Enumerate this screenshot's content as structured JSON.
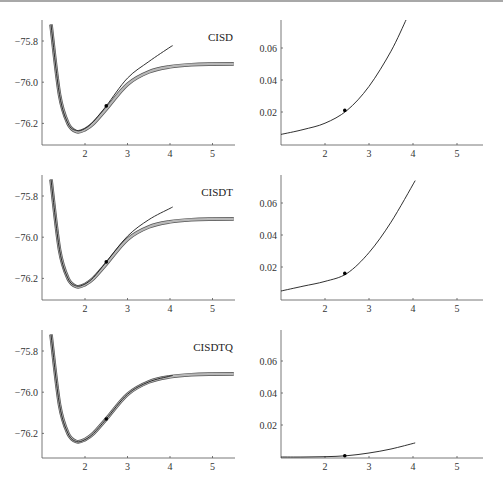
{
  "chart_data": [
    {
      "type": "line",
      "panel": "row1-left",
      "label": "CISD",
      "xlabel": "",
      "ylabel": "",
      "xlim": [
        1.0,
        5.5
      ],
      "ylim": [
        -76.3,
        -75.7
      ],
      "xticks": [
        2,
        3,
        4,
        5
      ],
      "yticks": [
        -75.8,
        -76.0,
        -76.2
      ],
      "ytick_labels": [
        "-75.8",
        "-76.0",
        "-76.2"
      ],
      "series": [
        {
          "name": "exact (thick gray)",
          "x": [
            1.2,
            1.4,
            1.6,
            1.8,
            2.0,
            2.2,
            2.5,
            3.0,
            3.5,
            4.0,
            4.5,
            5.0,
            5.5
          ],
          "y": [
            -75.72,
            -76.06,
            -76.2,
            -76.24,
            -76.23,
            -76.2,
            -76.13,
            -76.01,
            -75.95,
            -75.925,
            -75.915,
            -75.912,
            -75.911
          ]
        },
        {
          "name": "approximation (thin black)",
          "x": [
            1.2,
            1.4,
            1.6,
            1.8,
            2.0,
            2.2,
            2.5,
            3.0,
            3.5,
            4.0,
            4.05
          ],
          "y": [
            -75.72,
            -76.06,
            -76.2,
            -76.235,
            -76.225,
            -76.19,
            -76.115,
            -75.98,
            -75.9,
            -75.83,
            -75.825
          ]
        }
      ],
      "marker": {
        "x": 2.5,
        "y": -76.115
      }
    },
    {
      "type": "line",
      "panel": "row1-right",
      "xlim": [
        1.0,
        5.5
      ],
      "ylim": [
        0,
        0.078
      ],
      "xticks": [
        2,
        3,
        4,
        5
      ],
      "yticks": [
        0.02,
        0.04,
        0.06
      ],
      "series": [
        {
          "name": "error",
          "x": [
            1.0,
            1.5,
            2.0,
            2.5,
            3.0,
            3.5,
            3.85
          ],
          "y": [
            0.006,
            0.009,
            0.013,
            0.021,
            0.036,
            0.058,
            0.078
          ]
        }
      ],
      "marker": {
        "x": 2.45,
        "y": 0.021
      }
    },
    {
      "type": "line",
      "panel": "row2-left",
      "label": "CISDT",
      "xlim": [
        1.0,
        5.5
      ],
      "ylim": [
        -76.3,
        -75.7
      ],
      "xticks": [
        2,
        3,
        4,
        5
      ],
      "yticks": [
        -75.8,
        -76.0,
        -76.2
      ],
      "ytick_labels": [
        "-75.8",
        "-76.0",
        "-76.2"
      ],
      "series": [
        {
          "name": "exact (thick gray)",
          "x": [
            1.2,
            1.4,
            1.6,
            1.8,
            2.0,
            2.2,
            2.5,
            3.0,
            3.5,
            4.0,
            4.5,
            5.0,
            5.5
          ],
          "y": [
            -75.72,
            -76.06,
            -76.2,
            -76.24,
            -76.23,
            -76.2,
            -76.13,
            -76.01,
            -75.95,
            -75.925,
            -75.915,
            -75.912,
            -75.911
          ]
        },
        {
          "name": "approximation (thin black)",
          "x": [
            1.2,
            1.4,
            1.6,
            1.8,
            2.0,
            2.2,
            2.5,
            3.0,
            3.5,
            4.0,
            4.05
          ],
          "y": [
            -75.72,
            -76.06,
            -76.2,
            -76.237,
            -76.227,
            -76.195,
            -76.12,
            -75.995,
            -75.915,
            -75.86,
            -75.855
          ]
        }
      ],
      "marker": {
        "x": 2.5,
        "y": -76.12
      }
    },
    {
      "type": "line",
      "panel": "row2-right",
      "xlim": [
        1.0,
        5.5
      ],
      "ylim": [
        0,
        0.078
      ],
      "xticks": [
        2,
        3,
        4,
        5
      ],
      "yticks": [
        0.02,
        0.04,
        0.06
      ],
      "series": [
        {
          "name": "error",
          "x": [
            1.0,
            1.5,
            2.0,
            2.5,
            3.0,
            3.5,
            4.05
          ],
          "y": [
            0.005,
            0.008,
            0.011,
            0.016,
            0.029,
            0.048,
            0.074
          ]
        }
      ],
      "marker": {
        "x": 2.45,
        "y": 0.016
      }
    },
    {
      "type": "line",
      "panel": "row3-left",
      "label": "CISDTQ",
      "xlim": [
        1.0,
        5.5
      ],
      "ylim": [
        -76.3,
        -75.7
      ],
      "xticks": [
        2,
        3,
        4,
        5
      ],
      "yticks": [
        -75.8,
        -76.0,
        -76.2
      ],
      "ytick_labels": [
        "-75.8",
        "-76.0",
        "-76.2"
      ],
      "series": [
        {
          "name": "exact (thick gray)",
          "x": [
            1.2,
            1.4,
            1.6,
            1.8,
            2.0,
            2.2,
            2.5,
            3.0,
            3.5,
            4.0,
            4.5,
            5.0,
            5.5
          ],
          "y": [
            -75.72,
            -76.06,
            -76.2,
            -76.24,
            -76.23,
            -76.2,
            -76.13,
            -76.01,
            -75.95,
            -75.925,
            -75.915,
            -75.912,
            -75.911
          ]
        },
        {
          "name": "approximation (thin black)",
          "x": [
            1.2,
            1.4,
            1.6,
            1.8,
            2.0,
            2.2,
            2.5,
            3.0,
            3.5,
            4.0,
            4.05
          ],
          "y": [
            -75.72,
            -76.06,
            -76.2,
            -76.24,
            -76.23,
            -76.2,
            -76.13,
            -76.01,
            -75.95,
            -75.922,
            -75.92
          ]
        }
      ],
      "marker": {
        "x": 2.5,
        "y": -76.13
      }
    },
    {
      "type": "line",
      "panel": "row3-right",
      "xlim": [
        1.0,
        5.5
      ],
      "ylim": [
        0,
        0.078
      ],
      "xticks": [
        2,
        3,
        4,
        5
      ],
      "yticks": [
        0.02,
        0.04,
        0.06
      ],
      "series": [
        {
          "name": "error",
          "x": [
            1.0,
            1.5,
            2.0,
            2.5,
            3.0,
            3.5,
            4.05
          ],
          "y": [
            0.0,
            0.0,
            0.0002,
            0.0008,
            0.0025,
            0.005,
            0.0088
          ]
        }
      ],
      "marker": {
        "x": 2.45,
        "y": 0.0008
      }
    }
  ],
  "labels": {
    "row1": "CISD",
    "row2": "CISDT",
    "row3": "CISDTQ"
  },
  "xtick_labels": [
    "2",
    "3",
    "4",
    "5"
  ],
  "left_ytick_labels": [
    "-75.8",
    "-76.0",
    "-76.2"
  ],
  "right_ytick_labels": [
    "0.06",
    "0.04",
    "0.02"
  ],
  "colors": {
    "exact": "#8a8a8a",
    "approx": "#1a1a1a",
    "axis": "#555555"
  }
}
